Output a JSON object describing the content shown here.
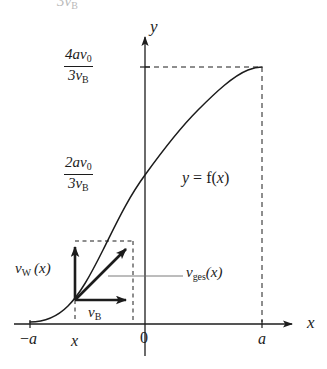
{
  "figure": {
    "type": "math-diagram",
    "background_color": "#ffffff",
    "ink_color": "#1c1c1c"
  },
  "axes": {
    "x_axis_label": "x",
    "y_axis_label": "y",
    "x_ticks": [
      {
        "id": "neg-a",
        "label_parts": {
          "sign": "−",
          "symbol": "a"
        },
        "label": "−a",
        "x_px": 30
      },
      {
        "id": "x",
        "label": "x",
        "x_px": 75
      },
      {
        "id": "origin",
        "label": "0",
        "x_px": 145
      },
      {
        "id": "a",
        "label": "a",
        "x_px": 262
      }
    ],
    "y_values": [
      {
        "id": "upper",
        "numerator": "4av",
        "numerator_sub": "0",
        "denominator": "3v",
        "denominator_sub": "B",
        "plain": "4av0/3vB",
        "y_px": 67
      },
      {
        "id": "lower",
        "numerator": "2av",
        "numerator_sub": "0",
        "denominator": "3v",
        "denominator_sub": "B",
        "plain": "2av0/3vB",
        "y_px": 175
      }
    ]
  },
  "curve": {
    "equation_label": {
      "lhs": "y",
      "equals": "=",
      "fn": "f",
      "open": "(",
      "arg": "x",
      "close": ")",
      "plain": "y = f(x)"
    }
  },
  "vectors": [
    {
      "id": "v-w",
      "label_base": "v",
      "label_sub": "W",
      "label_arg": "(x)",
      "plain": "vW(x)",
      "direction": "vertical-up",
      "origin_px": [
        75,
        300
      ],
      "tip_px": [
        75,
        243
      ]
    },
    {
      "id": "v-b",
      "label_base": "v",
      "label_sub": "B",
      "label_arg": "",
      "plain": "vB",
      "direction": "horizontal-right",
      "origin_px": [
        75,
        300
      ],
      "tip_px": [
        132,
        300
      ]
    },
    {
      "id": "v-ges",
      "label_base": "v",
      "label_sub": "ges",
      "label_arg": "(x)",
      "plain": "vges(x)",
      "direction": "diagonal-up-right",
      "origin_px": [
        75,
        300
      ],
      "tip_px": [
        131,
        243
      ]
    }
  ],
  "top_clipped_text": "3v"
}
